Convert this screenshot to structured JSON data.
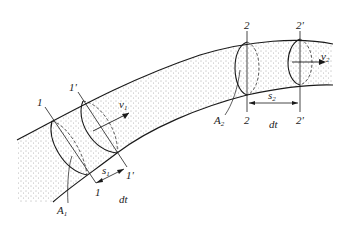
{
  "diagram": {
    "type": "streamtube-continuity",
    "colors": {
      "stroke": "#1a1a1a",
      "fill": "#f4f4f4",
      "dots": "#555555"
    },
    "section1": {
      "label_start": "1",
      "label_end": "1'",
      "area": "A",
      "area_sub": "1",
      "velocity": "v",
      "velocity_sub": "1",
      "displacement": "s",
      "displacement_sub": "1",
      "time": "dt"
    },
    "section2": {
      "label_start": "2",
      "label_end": "2'",
      "area": "A",
      "area_sub": "2",
      "velocity": "v",
      "velocity_sub": "2",
      "displacement": "s",
      "displacement_sub": "2",
      "time": "dt"
    }
  }
}
